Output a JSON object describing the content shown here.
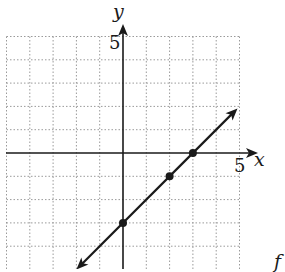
{
  "chart_data": {
    "type": "line",
    "title": "",
    "xlabel": "x",
    "ylabel": "y",
    "xlim": [
      -5,
      5
    ],
    "ylim": [
      -5,
      5
    ],
    "grid": true,
    "grid_style": "dotted",
    "tick_labels": {
      "x": [
        "5"
      ],
      "y": [
        "5"
      ]
    },
    "series": [
      {
        "name": "line",
        "equation": "y = x - 3",
        "slope": 1,
        "intercept": -3,
        "arrows_both_ends": true,
        "x_range": [
          -2,
          5
        ],
        "points": [
          {
            "x": 0,
            "y": -3
          },
          {
            "x": 2,
            "y": -1
          },
          {
            "x": 3,
            "y": 0
          }
        ]
      }
    ],
    "legend": null
  },
  "labels": {
    "x_axis": "x",
    "y_axis": "y",
    "x_tick": "5",
    "y_tick": "5",
    "corner_glyph": "f"
  },
  "colors": {
    "line": "#1a1a1a",
    "grid": "#9a9a9a",
    "axis": "#1a1a1a",
    "background": "#ffffff"
  }
}
